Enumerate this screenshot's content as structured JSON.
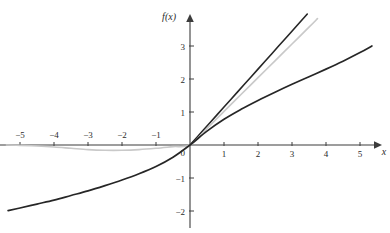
{
  "chart_data": {
    "type": "line",
    "title": "",
    "xlabel": "x",
    "ylabel": "f(x)",
    "xlim": [
      -5.6,
      5.7
    ],
    "ylim": [
      -2.3,
      3.6
    ],
    "grid": false,
    "legend": "none",
    "x_ticks": [
      -5,
      -4,
      -3,
      -2,
      -1,
      1,
      2,
      3,
      4,
      5
    ],
    "x_tick_labels": [
      "−5",
      "−4",
      "−3",
      "−2",
      "−1",
      "1",
      "2",
      "3",
      "4",
      "5"
    ],
    "y_ticks": [
      -2,
      -1,
      1,
      2,
      3
    ],
    "y_tick_labels": [
      "−2",
      "−1",
      "1",
      "2",
      "3"
    ],
    "origin_label": "0",
    "series": [
      {
        "name": "steep-dark-line",
        "color": "#262626",
        "width": 1.6,
        "x": [
          0,
          0.4,
          0.8,
          1.2,
          1.6,
          2.0,
          2.4,
          2.8,
          3.2,
          3.45
        ],
        "values": [
          0,
          0.46,
          0.92,
          1.38,
          1.84,
          2.3,
          2.76,
          3.22,
          3.68,
          3.97
        ]
      },
      {
        "name": "light-gray-curve",
        "color": "#c9c9c9",
        "width": 1.6,
        "x": [
          -5.4,
          -5.0,
          -4.5,
          -4.0,
          -3.5,
          -3.0,
          -2.5,
          -2.0,
          -1.5,
          -1.0,
          -0.5,
          0,
          0.5,
          1.0,
          1.5,
          2.0,
          2.5,
          3.0,
          3.5,
          3.75
        ],
        "values": [
          0.0,
          -0.01,
          -0.03,
          -0.06,
          -0.1,
          -0.14,
          -0.16,
          -0.16,
          -0.14,
          -0.1,
          -0.05,
          0,
          0.5,
          1.02,
          1.53,
          2.04,
          2.55,
          3.06,
          3.57,
          3.83
        ]
      },
      {
        "name": "shallow-dark-curve",
        "color": "#262626",
        "width": 1.7,
        "x": [
          -5.35,
          -5.0,
          -4.5,
          -4.0,
          -3.5,
          -3.0,
          -2.5,
          -2.0,
          -1.5,
          -1.0,
          -0.5,
          0,
          0.5,
          1.0,
          1.5,
          2.0,
          2.5,
          3.0,
          3.5,
          4.0,
          4.5,
          5.0,
          5.35
        ],
        "values": [
          -1.99,
          -1.91,
          -1.79,
          -1.67,
          -1.53,
          -1.39,
          -1.23,
          -1.06,
          -0.87,
          -0.65,
          -0.37,
          0,
          0.42,
          0.78,
          1.08,
          1.35,
          1.6,
          1.84,
          2.07,
          2.3,
          2.54,
          2.8,
          3.0
        ]
      }
    ]
  },
  "axes": {
    "x_axis_name": "x-axis",
    "y_axis_name": "y-axis",
    "x_label": "x",
    "y_label": "f(x)"
  }
}
